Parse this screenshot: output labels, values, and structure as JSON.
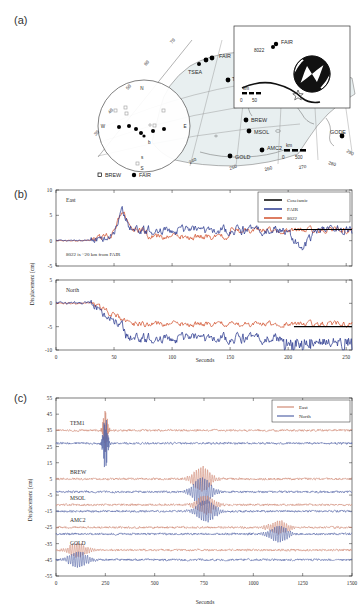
{
  "figure": {
    "panels": [
      {
        "tag": "(a)",
        "type": "map"
      },
      {
        "tag": "(b)",
        "type": "timeseries"
      },
      {
        "tag": "(c)",
        "type": "timeseries"
      }
    ]
  },
  "panel_a": {
    "tag": "(a)",
    "stations": [
      {
        "name": "FAIR",
        "x": 206,
        "y": 46,
        "marker": "filled-circle"
      },
      {
        "name": "TSEA",
        "x": 168,
        "y": 64,
        "marker": "filled-circle"
      },
      {
        "name": "TEM1",
        "x": 190,
        "y": 71,
        "marker": "filled-circle"
      },
      {
        "name": "BREW",
        "x": 212,
        "y": 108,
        "marker": "filled-circle"
      },
      {
        "name": "MSOL",
        "x": 215,
        "y": 119,
        "marker": "filled-circle"
      },
      {
        "name": "GOLD",
        "x": 196,
        "y": 143,
        "marker": "filled-circle"
      },
      {
        "name": "AMC2",
        "x": 228,
        "y": 138,
        "marker": "filled-circle"
      },
      {
        "name": "GODE",
        "x": 318,
        "y": 126,
        "marker": "filled-circle"
      }
    ],
    "lon_ticks": [
      "240",
      "250",
      "260",
      "270",
      "280",
      "290"
    ],
    "lat_ticks": [
      "30",
      "40",
      "50",
      "60",
      "70"
    ],
    "compass": [
      "N",
      "S",
      "E",
      "W"
    ],
    "scalebar_main": {
      "unit": "km",
      "min": "0",
      "max": "500"
    },
    "legend": [
      {
        "symbol": "open-square",
        "label": "BREW"
      },
      {
        "symbol": "filled-circle",
        "label": "FAIR"
      }
    ],
    "inset": {
      "labels": [
        "FAIR",
        "8022"
      ],
      "scalebar": {
        "unit": "km",
        "min": "0",
        "max": "50"
      },
      "mechanism": "beachball"
    }
  },
  "panel_b": {
    "tag": "(b)",
    "ylabel": "Displacement (cm)",
    "xlabel": "Seconds",
    "annotation": "8022 is ~20 km from FAIR",
    "legend": [
      {
        "label": "Coseismic",
        "color": "#000000"
      },
      {
        "label": "FAIR",
        "color": "#2b3a8f"
      },
      {
        "label": "8022",
        "color": "#d2522e"
      }
    ],
    "subplots": [
      {
        "component": "East",
        "ylim": [
          -5,
          10
        ],
        "yticks": [
          "10",
          "5",
          "0",
          "-5"
        ],
        "xlim": [
          0,
          255
        ],
        "xticks": [
          "0",
          "50",
          "100",
          "150",
          "200",
          "250"
        ],
        "coseismic_level": 2.2,
        "coseismic_start": 205
      },
      {
        "component": "North",
        "ylim": [
          -10,
          5
        ],
        "yticks": [
          "5",
          "0",
          "-5",
          "-10"
        ],
        "xlim": [
          0,
          255
        ],
        "xticks": [
          "0",
          "50",
          "100",
          "150",
          "200",
          "250"
        ],
        "coseismic_level": -5.0,
        "coseismic_start": 205
      }
    ]
  },
  "panel_c": {
    "tag": "(c)",
    "ylabel": "Displacement (cm)",
    "xlabel": "Seconds",
    "ylim": [
      -55,
      55
    ],
    "yticks": [
      "55",
      "45",
      "35",
      "25",
      "15",
      "5",
      "-5",
      "-15",
      "-25",
      "-35",
      "-45",
      "-55"
    ],
    "xlim": [
      0,
      1500
    ],
    "xticks": [
      "0",
      "250",
      "500",
      "750",
      "1000",
      "1250",
      "1500"
    ],
    "legend": [
      {
        "label": "East",
        "color": "#d08a76"
      },
      {
        "label": "North",
        "color": "#5566a8"
      }
    ],
    "stations": [
      {
        "name": "TEM1",
        "east_offset": 35,
        "north_offset": 27,
        "burst_time": 250,
        "burst_amp": 13
      },
      {
        "name": "BREW",
        "east_offset": 5,
        "north_offset": -3,
        "burst_time": 740,
        "burst_amp": 9
      },
      {
        "name": "MSOL",
        "east_offset": -11,
        "north_offset": -15,
        "burst_time": 760,
        "burst_amp": 7
      },
      {
        "name": "AMC2",
        "east_offset": -25,
        "north_offset": -29,
        "burst_time": 1130,
        "burst_amp": 5
      },
      {
        "name": "GOLD",
        "east_offset": -39,
        "north_offset": -45,
        "burst_time": 110,
        "burst_amp": 5
      }
    ]
  },
  "chart_data": {
    "type": "line",
    "title": "",
    "panels": [
      {
        "id": "b-east",
        "xlabel": "Seconds",
        "ylabel": "Displacement (cm)",
        "xlim": [
          0,
          255
        ],
        "ylim": [
          -5,
          10
        ],
        "series": [
          {
            "name": "FAIR",
            "color": "#2b3a8f"
          },
          {
            "name": "8022",
            "color": "#d2522e"
          },
          {
            "name": "Coseismic",
            "color": "#000000",
            "value": 2.2
          }
        ]
      },
      {
        "id": "b-north",
        "xlabel": "Seconds",
        "ylabel": "Displacement (cm)",
        "xlim": [
          0,
          255
        ],
        "ylim": [
          -10,
          5
        ],
        "series": [
          {
            "name": "FAIR",
            "color": "#2b3a8f"
          },
          {
            "name": "8022",
            "color": "#d2522e"
          },
          {
            "name": "Coseismic",
            "color": "#000000",
            "value": -5.0
          }
        ]
      },
      {
        "id": "c-stack",
        "xlabel": "Seconds",
        "ylabel": "Displacement (cm)",
        "xlim": [
          0,
          1500
        ],
        "ylim": [
          -55,
          55
        ],
        "series": [
          {
            "name": "East",
            "color": "#d08a76"
          },
          {
            "name": "North",
            "color": "#5566a8"
          }
        ]
      }
    ]
  }
}
